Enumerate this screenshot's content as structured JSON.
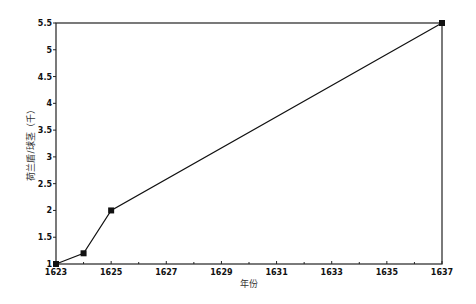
{
  "chart_data": {
    "type": "line",
    "title": "",
    "xlabel": "年份",
    "ylabel": "荷兰盾/球茎（千）",
    "x": [
      1623,
      1624,
      1625,
      1637
    ],
    "series": [
      {
        "name": "price",
        "values": [
          1.0,
          1.2,
          2.0,
          5.5
        ],
        "marker": "square",
        "color": "#111111"
      }
    ],
    "xlim": [
      1623,
      1637
    ],
    "ylim": [
      1,
      5.5
    ],
    "x_ticks": [
      1623,
      1625,
      1627,
      1629,
      1631,
      1633,
      1635,
      1637
    ],
    "x_minor_ticks": [
      1624,
      1626,
      1628,
      1630,
      1632,
      1634,
      1636
    ],
    "y_ticks": [
      1,
      1.5,
      2,
      2.5,
      3,
      3.5,
      4,
      4.5,
      5,
      5.5
    ],
    "grid": false,
    "legend": null
  },
  "colors": {
    "line": "#111111",
    "axis": "#222222",
    "background": "#ffffff"
  }
}
